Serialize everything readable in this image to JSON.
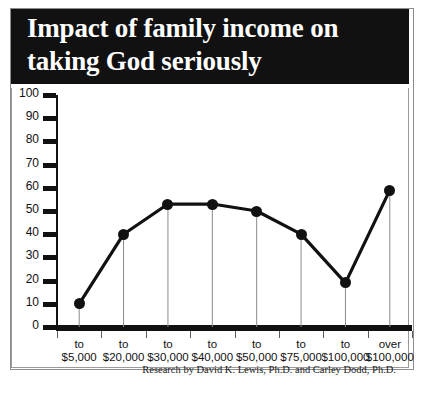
{
  "title": "Impact of family income on taking God seriously",
  "attribution": "Research by David K. Lewis, Ph.D. and Carley Dodd, Ph.D.",
  "colors": {
    "banner_background": "#111111",
    "banner_text": "#ffffff",
    "line": "#111111",
    "marker": "#111111",
    "dropline": "#8a8a8a",
    "axis": "#111111",
    "frame": "#8d8d8d",
    "background": "#ffffff"
  },
  "chart_data": {
    "type": "line",
    "title": "Impact of family income on taking God seriously",
    "xlabel": "",
    "ylabel": "",
    "categories": [
      "to $5,000",
      "to $20,000",
      "to $30,000",
      "to $40,000",
      "to $50,000",
      "to $75,000",
      "to $100,000",
      "over $100,000"
    ],
    "category_lines": [
      [
        "to",
        "$5,000"
      ],
      [
        "to",
        "$20,000"
      ],
      [
        "to",
        "$30,000"
      ],
      [
        "to",
        "$40,000"
      ],
      [
        "to",
        "$50,000"
      ],
      [
        "to",
        "$75,000"
      ],
      [
        "to",
        "$100,000"
      ],
      [
        "over",
        "$100,000"
      ]
    ],
    "values": [
      10,
      40,
      53,
      53,
      50,
      40,
      19,
      59
    ],
    "ylim": [
      0,
      100
    ],
    "ytick_labels": [
      "100",
      "90",
      "80",
      "70",
      "60",
      "50",
      "40",
      "30",
      "20",
      "10",
      "0"
    ],
    "ytick_values": [
      100,
      90,
      80,
      70,
      60,
      50,
      40,
      30,
      20,
      10,
      0
    ],
    "grid": false,
    "legend": "none",
    "droplines": true,
    "markers": "filled-circle"
  }
}
